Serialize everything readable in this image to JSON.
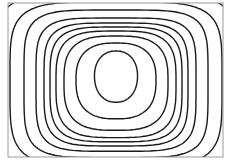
{
  "diagram": {
    "type": "contour-plot",
    "frame": {
      "x": 8,
      "y": 3,
      "width": 215,
      "height": 154,
      "color": "#9a9a9a"
    },
    "line_color": "#1a1a1a",
    "center": {
      "x": 116,
      "y": 76
    },
    "contours": [
      {
        "rx": 21.5,
        "ry": 25,
        "cy": 76,
        "n": 2.2
      },
      {
        "rx": 40,
        "ry": 37,
        "cy": 80,
        "n": 2.6
      },
      {
        "rx": 52,
        "ry": 46,
        "cy": 82,
        "n": 3.0
      },
      {
        "rx": 60,
        "ry": 52,
        "cy": 83,
        "n": 3.4
      },
      {
        "rx": 66,
        "ry": 56,
        "cy": 83,
        "n": 3.8
      },
      {
        "rx": 72,
        "ry": 60,
        "cy": 83,
        "n": 4.2
      },
      {
        "rx": 80,
        "ry": 65,
        "cy": 83,
        "n": 4.6
      },
      {
        "rx": 92,
        "ry": 72,
        "cy": 82,
        "n": 4.8
      },
      {
        "rx": 106,
        "ry": 80,
        "cy": 82,
        "n": 4.6
      },
      {
        "rx": 125,
        "ry": 92,
        "cy": 82,
        "n": 4.0
      },
      {
        "rx": 150,
        "ry": 108,
        "cy": 84,
        "n": 3.4
      }
    ]
  }
}
